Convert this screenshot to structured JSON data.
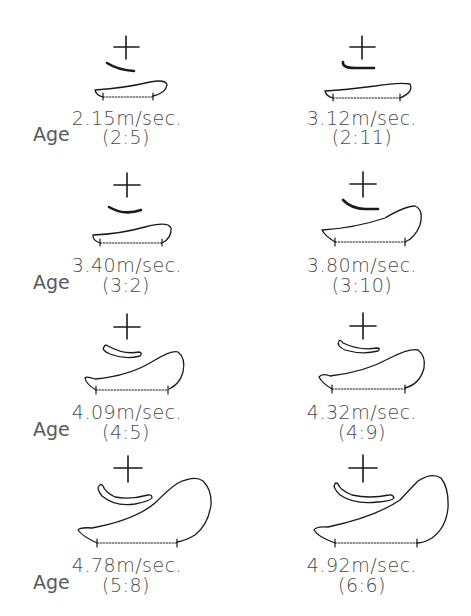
{
  "figure": {
    "age_label": "Age",
    "panels": [
      {
        "id": "p1",
        "speed": "2.15m/sec.",
        "age": "(2:5)",
        "column": "left",
        "row": 1,
        "show_age_label": true
      },
      {
        "id": "p2",
        "speed": "3.12m/sec.",
        "age": "(2:11)",
        "column": "right",
        "row": 1,
        "show_age_label": false
      },
      {
        "id": "p3",
        "speed": "3.40m/sec.",
        "age": "(3:2)",
        "column": "left",
        "row": 2,
        "show_age_label": true
      },
      {
        "id": "p4",
        "speed": "3.80m/sec.",
        "age": "(3:10)",
        "column": "right",
        "row": 2,
        "show_age_label": false
      },
      {
        "id": "p5",
        "speed": "4.09m/sec.",
        "age": "(4:5)",
        "column": "left",
        "row": 3,
        "show_age_label": true
      },
      {
        "id": "p6",
        "speed": "4.32m/sec.",
        "age": "(4:9)",
        "column": "right",
        "row": 3,
        "show_age_label": false
      },
      {
        "id": "p7",
        "speed": "4.78m/sec.",
        "age": "(5:8)",
        "column": "left",
        "row": 4,
        "show_age_label": true
      },
      {
        "id": "p8",
        "speed": "4.92m/sec.",
        "age": "(6:6)",
        "column": "right",
        "row": 4,
        "show_age_label": false
      }
    ],
    "icons": {
      "cross": "plus-cross-marker",
      "tongue": "curved-stroke",
      "body": "bulb-outline",
      "measure": "dotted-measure-line"
    },
    "colors": {
      "line": "#1a1a1a",
      "text": "#4a4a4a",
      "background": "#ffffff"
    }
  }
}
